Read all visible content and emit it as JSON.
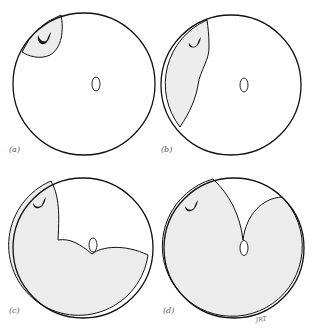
{
  "figure": {
    "colors": {
      "outline": "#111111",
      "shade": "#ececec",
      "background": "#ffffff",
      "label": "#555555"
    },
    "panels": [
      {
        "id": "a",
        "label": "(a)",
        "description": "Small shaded region at upper-left containing the crescent mark; central oval unshaded"
      },
      {
        "id": "b",
        "label": "(b)",
        "description": "Shaded region expanded along left side of circle"
      },
      {
        "id": "c",
        "label": "(c)",
        "description": "Shaded region covers left and bottom, boundary dips to touch the central oval"
      },
      {
        "id": "d",
        "label": "(d)",
        "description": "Shaded region covers nearly all; unshaded wedge at top bounded by two curves meeting at the central oval"
      }
    ],
    "signature": "JRT"
  }
}
